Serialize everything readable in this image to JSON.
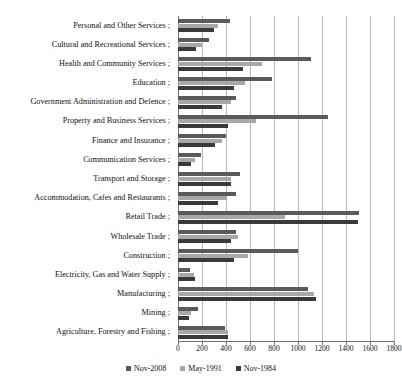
{
  "chart_data": {
    "type": "bar",
    "orientation": "horizontal",
    "title": "",
    "xlabel": "",
    "ylabel": "",
    "xlim": [
      0,
      1800
    ],
    "xticks": [
      0,
      200,
      400,
      600,
      800,
      1000,
      1200,
      1400,
      1600,
      1800
    ],
    "grid": true,
    "legend_position": "bottom",
    "categories": [
      "Personal and Other Services ;",
      "Cultural and Recreational Services ;",
      "Health and Community Services ;",
      "Education ;",
      "Government Administration and Defence ;",
      "Property and Business Services ;",
      "Finance and Insurance ;",
      "Communication Services ;",
      "Transport and Storage ;",
      "Accommodation, Cafes and Restaurants ;",
      "Retail Trade ;",
      "Wholesale Trade ;",
      "Construction ;",
      "Electricity, Gas and Water Supply ;",
      "Manufacturing ;",
      "Mining ;",
      "Agriculture, Forestry and Fishing ;"
    ],
    "series": [
      {
        "name": "Nov-2008",
        "color": "#5a5a5a",
        "values": [
          430,
          260,
          1110,
          780,
          480,
          1250,
          400,
          190,
          520,
          480,
          1510,
          480,
          1000,
          100,
          1080,
          170,
          390
        ]
      },
      {
        "name": "May-1991",
        "color": "#a8a8a8",
        "values": [
          330,
          200,
          700,
          560,
          440,
          650,
          370,
          140,
          440,
          410,
          890,
          500,
          580,
          130,
          1130,
          105,
          420
        ]
      },
      {
        "name": "Nov-1984",
        "color": "#3a3a3a",
        "values": [
          300,
          150,
          540,
          470,
          370,
          420,
          310,
          110,
          440,
          330,
          1500,
          440,
          470,
          140,
          1150,
          95,
          420
        ]
      }
    ]
  },
  "legend": {
    "items": [
      {
        "label": "Nov-2008",
        "color": "#5a5a5a"
      },
      {
        "label": "May-1991",
        "color": "#a8a8a8"
      },
      {
        "label": "Nov-1984",
        "color": "#3a3a3a"
      }
    ]
  }
}
